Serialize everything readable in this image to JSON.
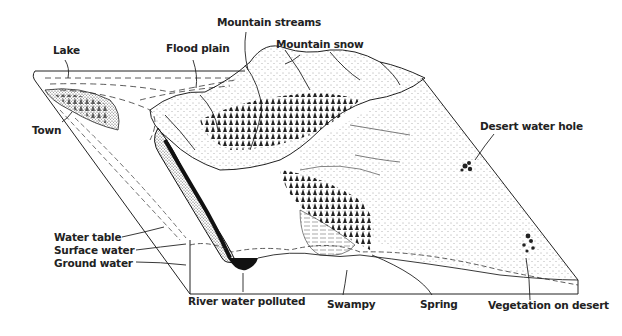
{
  "diagram": {
    "type": "block-diagram",
    "colors": {
      "ink": "#222222",
      "background": "#ffffff"
    },
    "labels": {
      "mountain_streams": "Mountain streams",
      "mountain_snow": "Mountain snow",
      "lake": "Lake",
      "flood_plain": "Flood plain",
      "town": "Town",
      "desert_water_hole": "Desert water hole",
      "water_table": "Water table",
      "surface_water": "Surface water",
      "ground_water": "Ground water",
      "river_water_polluted": "River water polluted",
      "swampy": "Swampy",
      "spring": "Spring",
      "vegetation_on_desert": "Vegetation on desert"
    }
  }
}
